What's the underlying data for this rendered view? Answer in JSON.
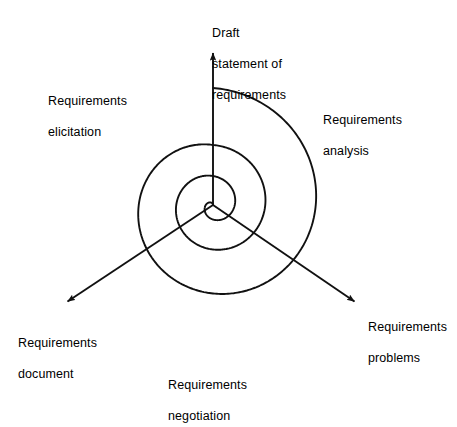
{
  "diagram": {
    "type": "spiral-process",
    "stroke_color": "#111111",
    "background_color": "#ffffff",
    "center": {
      "x": 213,
      "y": 205
    },
    "spiral": {
      "turns": 3,
      "description": "Archimedean spiral expanding outward from the centre through three complete turns",
      "radii_at_vertical_axis": [
        29,
        60,
        117
      ],
      "outer_tail_end": {
        "x": 42,
        "y": 205
      }
    },
    "axes": [
      {
        "name": "draft-statement-axis",
        "angle_deg": 90,
        "arrow_tip": {
          "x": 213,
          "y": 48
        },
        "label": "Draft\nstatement of\nrequirements"
      },
      {
        "name": "requirements-document-axis",
        "angle_deg": 210,
        "arrow_tip": {
          "x": 62,
          "y": 305
        },
        "label": "Requirements\ndocument"
      },
      {
        "name": "requirements-problems-axis",
        "angle_deg": 330,
        "arrow_tip": {
          "x": 360,
          "y": 305
        },
        "label": "Requirements\nproblems"
      }
    ],
    "labels": {
      "draft_statement": {
        "line1": "Draft",
        "line2": "statement of",
        "line3": "requirements"
      },
      "requirements_elicitation": {
        "line1": "Requirements",
        "line2": "elicitation"
      },
      "requirements_analysis": {
        "line1": "Requirements",
        "line2": "analysis"
      },
      "requirements_problems": {
        "line1": "Requirements",
        "line2": "problems"
      },
      "requirements_document": {
        "line1": "Requirements",
        "line2": "document"
      },
      "requirements_negotiation": {
        "line1": "Requirements",
        "line2": "negotiation"
      }
    },
    "quadrant_phases": [
      "Requirements elicitation",
      "Requirements analysis",
      "Requirements negotiation",
      "Requirements document"
    ]
  }
}
